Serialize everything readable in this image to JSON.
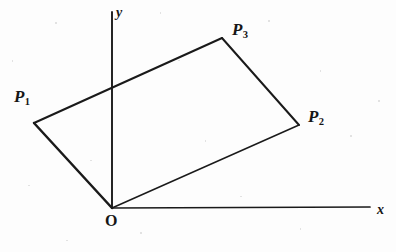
{
  "figure": {
    "type": "geometry-diagram",
    "background_color": "#fdfdfd",
    "ink_color": "#1a1a1a",
    "labels": {
      "origin": "O",
      "x_axis": "x",
      "y_axis": "y",
      "point1_base": "P",
      "point1_sub": "1",
      "point2_base": "P",
      "point2_sub": "2",
      "point3_base": "P",
      "point3_sub": "3"
    }
  },
  "chart_data": {
    "type": "scatter",
    "title": "",
    "xlabel": "x",
    "ylabel": "y",
    "grid": false,
    "legend": null,
    "axes": {
      "origin_px": [
        112,
        208
      ],
      "x_axis_px": [
        [
          112,
          208
        ],
        [
          370,
          207
        ]
      ],
      "y_axis_px": [
        [
          112,
          208
        ],
        [
          112,
          12
        ]
      ]
    },
    "points": [
      {
        "name": "O",
        "label": "O",
        "px": [
          112,
          208
        ]
      },
      {
        "name": "P1",
        "label": "P",
        "sub": "1",
        "px": [
          34,
          123
        ]
      },
      {
        "name": "P3",
        "label": "P",
        "sub": "3",
        "px": [
          222,
          38
        ]
      },
      {
        "name": "P2",
        "label": "P",
        "sub": "2",
        "px": [
          299,
          125
        ]
      }
    ],
    "polygon": {
      "name": "parallelogram",
      "vertices_px": [
        [
          112,
          208
        ],
        [
          34,
          123
        ],
        [
          222,
          38
        ],
        [
          299,
          125
        ]
      ],
      "closed": true,
      "filled": false
    },
    "edges": [
      {
        "from": "O",
        "to": "P1",
        "weight": "thick"
      },
      {
        "from": "P1",
        "to": "P3",
        "weight": "medium"
      },
      {
        "from": "P3",
        "to": "P2",
        "weight": "medium"
      },
      {
        "from": "P2",
        "to": "O",
        "weight": "thin"
      }
    ]
  }
}
